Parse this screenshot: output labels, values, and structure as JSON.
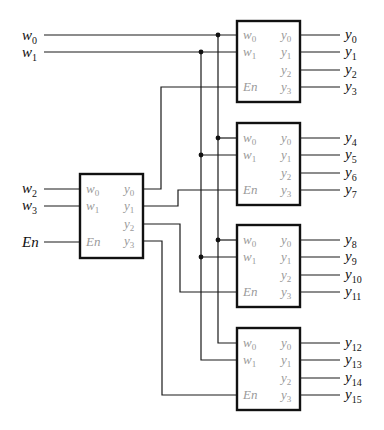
{
  "inputs": {
    "w0": {
      "base": "w",
      "sub": "0"
    },
    "w1": {
      "base": "w",
      "sub": "1"
    },
    "w2": {
      "base": "w",
      "sub": "2"
    },
    "w3": {
      "base": "w",
      "sub": "3"
    },
    "en": {
      "text": "En"
    }
  },
  "decoder_ports": {
    "w0": {
      "base": "w",
      "sub": "0"
    },
    "w1": {
      "base": "w",
      "sub": "1"
    },
    "en": "En",
    "y0": {
      "base": "y",
      "sub": "0"
    },
    "y1": {
      "base": "y",
      "sub": "1"
    },
    "y2": {
      "base": "y",
      "sub": "2"
    },
    "y3": {
      "base": "y",
      "sub": "3"
    }
  },
  "outputs": [
    {
      "base": "y",
      "sub": "0"
    },
    {
      "base": "y",
      "sub": "1"
    },
    {
      "base": "y",
      "sub": "2"
    },
    {
      "base": "y",
      "sub": "3"
    },
    {
      "base": "y",
      "sub": "4"
    },
    {
      "base": "y",
      "sub": "5"
    },
    {
      "base": "y",
      "sub": "6"
    },
    {
      "base": "y",
      "sub": "7"
    },
    {
      "base": "y",
      "sub": "8"
    },
    {
      "base": "y",
      "sub": "9"
    },
    {
      "base": "y",
      "sub": "10"
    },
    {
      "base": "y",
      "sub": "11"
    },
    {
      "base": "y",
      "sub": "12"
    },
    {
      "base": "y",
      "sub": "13"
    },
    {
      "base": "y",
      "sub": "14"
    },
    {
      "base": "y",
      "sub": "15"
    }
  ],
  "colors": {
    "wire": "#1a1a1a",
    "box_border": "#111111",
    "internal_label": "#9a9a9a",
    "external_label": "#111111"
  }
}
